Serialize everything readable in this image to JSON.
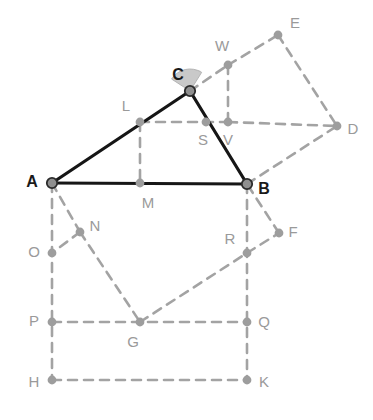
{
  "figure": {
    "background_color": "#ffffff",
    "colors": {
      "triangle_stroke": "#161616",
      "construction_stroke": "#a3a3a3",
      "vertex_fill": "#8f8f8f",
      "vertex_stroke": "#2b2b2b",
      "node_fill": "#9d9d9d",
      "angle_fill": "#c9c9c9",
      "angle_stroke": "#b4b4b4",
      "main_label_color": "#1a1a1a",
      "aux_label_color": "#9a9a9a"
    },
    "stroke_widths": {
      "triangle": 3.2,
      "construction": 2.6
    },
    "dash_pattern": "9 7"
  },
  "points": {
    "A": {
      "label": "A",
      "x": 52,
      "y": 183,
      "kind": "main",
      "label_x": 32,
      "label_y": 183
    },
    "B": {
      "label": "B",
      "x": 247,
      "y": 184,
      "kind": "main",
      "label_x": 264,
      "label_y": 190
    },
    "C": {
      "label": "C",
      "x": 190,
      "y": 91,
      "kind": "main",
      "label_x": 178,
      "label_y": 76
    },
    "D": {
      "label": "D",
      "x": 337,
      "y": 126,
      "kind": "aux",
      "label_x": 353,
      "label_y": 130
    },
    "E": {
      "label": "E",
      "x": 278,
      "y": 35,
      "kind": "aux",
      "label_x": 295,
      "label_y": 24
    },
    "F": {
      "label": "F",
      "x": 279,
      "y": 233,
      "kind": "aux",
      "label_x": 293,
      "label_y": 233
    },
    "G": {
      "label": "G",
      "x": 140,
      "y": 322,
      "kind": "aux",
      "label_x": 133,
      "label_y": 343
    },
    "H": {
      "label": "H",
      "x": 52,
      "y": 380,
      "kind": "aux",
      "label_x": 34,
      "label_y": 383
    },
    "K": {
      "label": "K",
      "x": 247,
      "y": 380,
      "kind": "aux",
      "label_x": 264,
      "label_y": 383
    },
    "L": {
      "label": "L",
      "x": 140,
      "y": 122,
      "kind": "aux",
      "label_x": 126,
      "label_y": 107
    },
    "M": {
      "label": "M",
      "x": 140,
      "y": 183,
      "kind": "aux",
      "label_x": 148,
      "label_y": 204
    },
    "N": {
      "label": "N",
      "x": 80,
      "y": 232,
      "kind": "aux",
      "label_x": 95,
      "label_y": 227
    },
    "O": {
      "label": "O",
      "x": 52,
      "y": 253,
      "kind": "aux",
      "label_x": 34,
      "label_y": 253
    },
    "P": {
      "label": "P",
      "x": 52,
      "y": 322,
      "kind": "aux",
      "label_x": 34,
      "label_y": 322
    },
    "Q": {
      "label": "Q",
      "x": 247,
      "y": 322,
      "kind": "aux",
      "label_x": 264,
      "label_y": 323
    },
    "R": {
      "label": "R",
      "x": 247,
      "y": 253,
      "kind": "aux",
      "label_x": 230,
      "label_y": 240
    },
    "S": {
      "label": "S",
      "x": 206,
      "y": 122,
      "kind": "aux",
      "label_x": 203,
      "label_y": 141
    },
    "V": {
      "label": "V",
      "x": 228,
      "y": 122,
      "kind": "aux",
      "label_x": 228,
      "label_y": 141
    },
    "W": {
      "label": "W",
      "x": 228,
      "y": 65,
      "kind": "aux",
      "label_x": 222,
      "label_y": 47
    }
  },
  "triangle_edges": [
    {
      "name": "edge-AB",
      "from": "A",
      "to": "B"
    },
    {
      "name": "edge-AC",
      "from": "A",
      "to": "C"
    },
    {
      "name": "edge-CB",
      "from": "C",
      "to": "B"
    }
  ],
  "construction_edges": [
    {
      "name": "edge-L-V",
      "from": "L",
      "to": "V"
    },
    {
      "name": "edge-V-D",
      "from": "V",
      "to": "D"
    },
    {
      "name": "edge-C-W",
      "from": "C",
      "to": "W"
    },
    {
      "name": "edge-W-E",
      "from": "W",
      "to": "E"
    },
    {
      "name": "edge-E-D",
      "from": "E",
      "to": "D"
    },
    {
      "name": "edge-W-V",
      "from": "W",
      "to": "V"
    },
    {
      "name": "edge-B-D",
      "from": "B",
      "to": "D"
    },
    {
      "name": "edge-L-M",
      "from": "L",
      "to": "M"
    },
    {
      "name": "edge-A-N",
      "from": "A",
      "to": "N"
    },
    {
      "name": "edge-N-O",
      "from": "N",
      "to": "O"
    },
    {
      "name": "edge-N-G",
      "from": "N",
      "to": "G"
    },
    {
      "name": "edge-A-H",
      "from": "A",
      "to": "H"
    },
    {
      "name": "edge-H-K",
      "from": "H",
      "to": "K"
    },
    {
      "name": "edge-B-K",
      "from": "B",
      "to": "K"
    },
    {
      "name": "edge-P-Q",
      "from": "P",
      "to": "Q"
    },
    {
      "name": "edge-G-R",
      "from": "G",
      "to": "R"
    },
    {
      "name": "edge-R-F",
      "from": "R",
      "to": "F"
    },
    {
      "name": "edge-F-B",
      "from": "F",
      "to": "B"
    }
  ],
  "angle_marker": {
    "name": "angle-at-C",
    "vertex": "C",
    "radius": 22,
    "start_deg": 147,
    "end_deg": 58
  }
}
